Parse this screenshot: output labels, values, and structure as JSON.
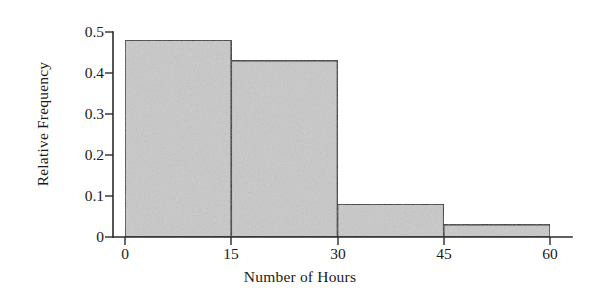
{
  "chart_data": {
    "type": "bar",
    "title": "",
    "subtitle": "",
    "xlabel": "Number of Hours",
    "ylabel": "Relative Frequency",
    "categories": [
      "0-15",
      "15-30",
      "30-45",
      "45-60"
    ],
    "bin_edges": [
      0,
      15,
      30,
      45,
      60
    ],
    "values": [
      0.48,
      0.43,
      0.08,
      0.03
    ],
    "xlim": [
      0,
      60
    ],
    "ylim": [
      0,
      0.5
    ],
    "x_ticks": [
      0,
      15,
      30,
      45,
      60
    ],
    "x_tick_labels": [
      "0",
      "15",
      "30",
      "45",
      "60"
    ],
    "y_ticks": [
      0,
      0.1,
      0.2,
      0.3,
      0.4,
      0.5
    ],
    "y_tick_labels": [
      "0",
      "0.1",
      "0.2",
      "0.3",
      "0.4",
      "0.5"
    ],
    "grid": false,
    "legend": null,
    "legend_position": "none",
    "bar_fill_color": "#c9c9c9",
    "bar_edge_color": "#2b2b2b",
    "axis_color": "#2b2b2b",
    "background_color": "#ffffff",
    "annotations": []
  }
}
